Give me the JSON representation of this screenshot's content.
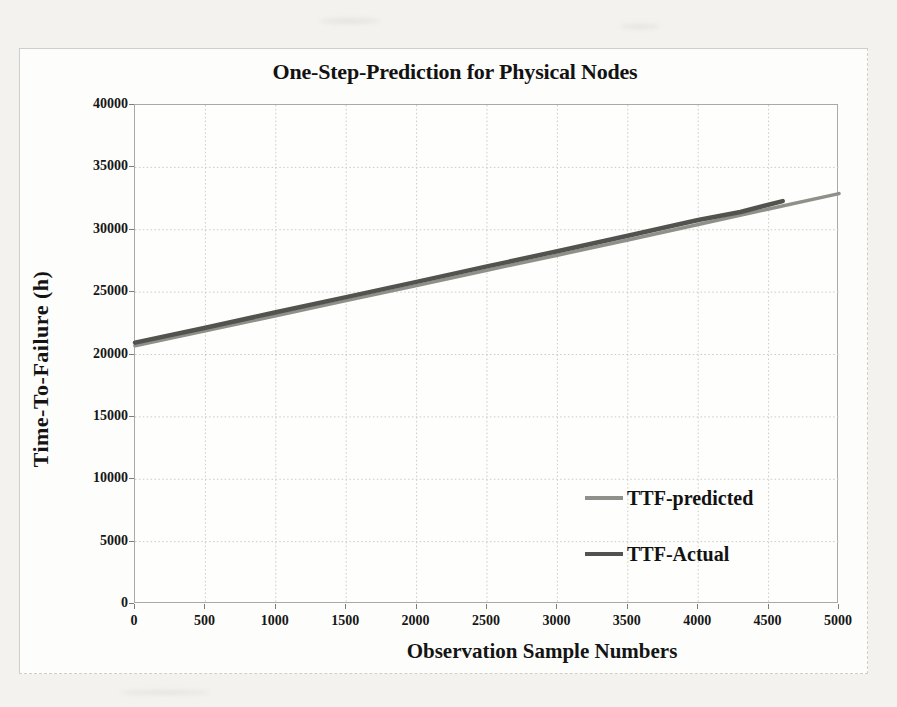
{
  "page": {
    "background_color": "#f3f2ef",
    "figure_background": "#fdfdfb"
  },
  "chart_data": {
    "type": "line",
    "title": "One-Step-Prediction for Physical Nodes",
    "xlabel": "Observation Sample Numbers",
    "ylabel": "Time-To-Failure (h)",
    "xlim": [
      0,
      5000
    ],
    "ylim": [
      0,
      40000
    ],
    "x_ticks": [
      0,
      500,
      1000,
      1500,
      2000,
      2500,
      3000,
      3500,
      4000,
      4500,
      5000
    ],
    "y_ticks": [
      0,
      5000,
      10000,
      15000,
      20000,
      25000,
      30000,
      35000,
      40000
    ],
    "grid": {
      "on": true,
      "vertical_step": 500,
      "horizontal_step": 5000,
      "style": "dotted",
      "color": "#cbcac5"
    },
    "legend": {
      "position": "inside-lower-right",
      "entries": [
        "TTF-predicted",
        "TTF-Actual"
      ]
    },
    "series": [
      {
        "name": "TTF-predicted",
        "color": "#8f908a",
        "width": 3.5,
        "points": [
          [
            0,
            20700
          ],
          [
            500,
            21900
          ],
          [
            1000,
            23100
          ],
          [
            1500,
            24320
          ],
          [
            2000,
            25520
          ],
          [
            2500,
            26760
          ],
          [
            3000,
            27960
          ],
          [
            3500,
            29180
          ],
          [
            4000,
            30420
          ],
          [
            4500,
            31660
          ],
          [
            5000,
            32900
          ]
        ]
      },
      {
        "name": "TTF-Actual",
        "color": "#52534f",
        "width": 4.5,
        "points": [
          [
            0,
            20950
          ],
          [
            500,
            22150
          ],
          [
            1000,
            23380
          ],
          [
            1500,
            24600
          ],
          [
            2000,
            25820
          ],
          [
            2500,
            27060
          ],
          [
            3000,
            28280
          ],
          [
            3500,
            29520
          ],
          [
            4000,
            30780
          ],
          [
            4300,
            31420
          ],
          [
            4600,
            32300
          ]
        ]
      }
    ]
  }
}
